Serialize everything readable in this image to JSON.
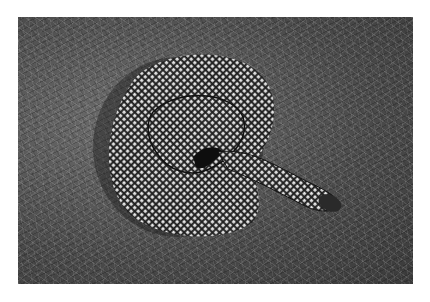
{
  "image": {
    "subject": "coiled speckled kingsnake on dry grass",
    "style": "black-and-white photograph",
    "colors": {
      "background": "#ffffff",
      "grass_dark": "#3a3a3a",
      "grass_mid": "#6e6e6e",
      "snake_light": "#e8e8e8",
      "snake_dark": "#202020"
    }
  }
}
